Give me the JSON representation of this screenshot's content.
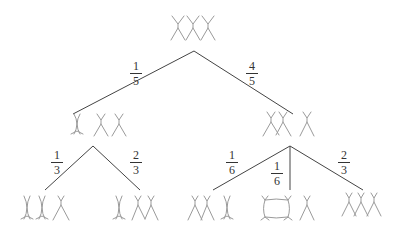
{
  "diagram": {
    "type": "probability-tree",
    "root": {
      "label": "three chromosomes (unpaired)"
    },
    "level1": [
      {
        "branch_probability": {
          "num": "1",
          "den": "5"
        },
        "label": "one paired, two unpaired"
      },
      {
        "branch_probability": {
          "num": "4",
          "den": "5"
        },
        "label": "two crossed, one unpaired"
      }
    ],
    "level2_left": [
      {
        "branch_probability": {
          "num": "1",
          "den": "3"
        },
        "label": "two paired, one unpaired"
      },
      {
        "branch_probability": {
          "num": "2",
          "den": "3"
        },
        "label": "one paired, two crossed"
      }
    ],
    "level2_right": [
      {
        "branch_probability": {
          "num": "1",
          "den": "6"
        },
        "label": "two crossed, one paired"
      },
      {
        "branch_probability": {
          "num": "1",
          "den": "6"
        },
        "label": "ring, one unpaired"
      },
      {
        "branch_probability": {
          "num": "2",
          "den": "3"
        },
        "label": "three crossed chain"
      }
    ]
  },
  "colors": {
    "line": "#444444",
    "chromosome": "#9a9a9a",
    "text": "#333333"
  }
}
